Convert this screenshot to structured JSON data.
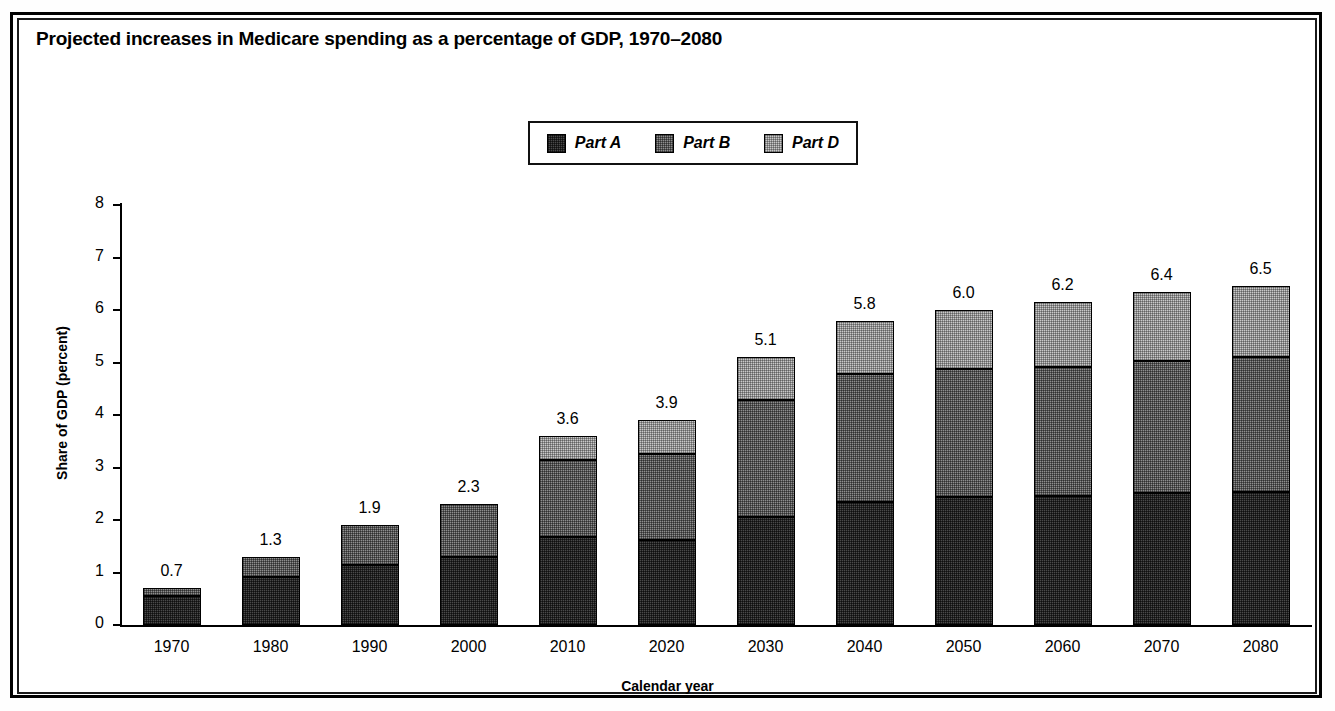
{
  "figure": {
    "title": "Projected increases in Medicare spending as a percentage of GDP, 1970–2080"
  },
  "legend": {
    "position": "top-center",
    "items": [
      {
        "label": "Part A",
        "swatch": "dark-hatch-swatch",
        "color": "#4a4a4a"
      },
      {
        "label": "Part B",
        "swatch": "medium-hatch-swatch",
        "color": "#8e8e8e"
      },
      {
        "label": "Part D",
        "swatch": "light-hatch-swatch",
        "color": "#c9c9c9"
      }
    ]
  },
  "axes": {
    "ylabel": "Share of GDP (percent)",
    "xlabel": "Calendar year",
    "yticks": [
      "0",
      "1",
      "2",
      "3",
      "4",
      "5",
      "6",
      "7",
      "8"
    ]
  },
  "chart_data": {
    "type": "bar",
    "stacked": true,
    "title": "Projected increases in Medicare spending as a percentage of GDP, 1970–2080",
    "xlabel": "Calendar year",
    "ylabel": "Share of GDP (percent)",
    "ylim": [
      0,
      8
    ],
    "ytick_step": 1,
    "grid": false,
    "legend_position": "top-center",
    "categories": [
      "1970",
      "1980",
      "1990",
      "2000",
      "2010",
      "2020",
      "2030",
      "2040",
      "2050",
      "2060",
      "2070",
      "2080"
    ],
    "series": [
      {
        "name": "Part A",
        "color": "#4a4a4a",
        "values": [
          0.55,
          0.92,
          1.14,
          1.29,
          1.67,
          1.62,
          2.06,
          2.34,
          2.43,
          2.45,
          2.51,
          2.53
        ]
      },
      {
        "name": "Part B",
        "color": "#8e8e8e",
        "values": [
          0.15,
          0.38,
          0.76,
          1.01,
          1.47,
          1.64,
          2.22,
          2.44,
          2.45,
          2.47,
          2.52,
          2.57
        ]
      },
      {
        "name": "Part D",
        "color": "#c9c9c9",
        "values": [
          0,
          0,
          0,
          0,
          0.46,
          0.64,
          0.82,
          1.02,
          1.12,
          1.23,
          1.31,
          1.35
        ]
      }
    ],
    "totals": [
      0.7,
      1.3,
      1.9,
      2.3,
      3.6,
      3.9,
      5.1,
      5.8,
      6.0,
      6.2,
      6.4,
      6.5
    ],
    "total_labels": [
      "0.7",
      "1.3",
      "1.9",
      "2.3",
      "3.6",
      "3.9",
      "5.1",
      "5.8",
      "6.0",
      "6.2",
      "6.4",
      "6.5"
    ]
  }
}
